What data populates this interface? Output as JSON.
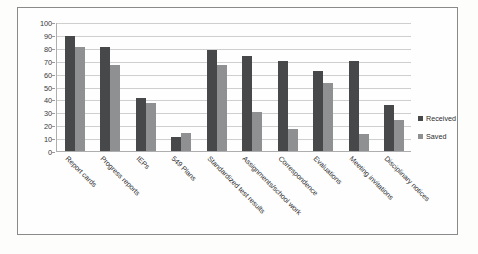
{
  "chart_data": {
    "type": "bar",
    "title": "",
    "subtitle": "",
    "xlabel": "",
    "ylabel": "",
    "ylim": [
      0,
      100
    ],
    "ytick_step": 10,
    "yticks": [
      100,
      90,
      80,
      70,
      60,
      50,
      40,
      30,
      20,
      10,
      0
    ],
    "grid": true,
    "grid_axis": "y",
    "legend_position": "right",
    "orientation": "vertical",
    "grouping": "grouped",
    "categories": [
      "Report cards",
      "Progress reports",
      "IEPs",
      "549 Plans",
      "Standardized test results",
      "Assignments/school work",
      "Correspondence",
      "Evaluations",
      "Meeting invitations",
      "Disciplinary notices"
    ],
    "series": [
      {
        "name": "Received",
        "color": "#46484a",
        "values": [
          89,
          81,
          41,
          11,
          78,
          74,
          70,
          62,
          70,
          36
        ]
      },
      {
        "name": "Saved",
        "color": "#8e9092",
        "values": [
          81,
          67,
          37,
          14,
          67,
          30,
          17,
          53,
          13,
          24
        ]
      }
    ]
  },
  "legend": {
    "items": [
      {
        "label": "Received",
        "swatch": "received"
      },
      {
        "label": "Saved",
        "swatch": "saved"
      }
    ]
  },
  "colors": {
    "received": "#46484a",
    "saved": "#8e9092",
    "gridline": "#cfcfcf",
    "axis": "#aeaeae",
    "frame": "#8a8a8a",
    "background": "#fefefe",
    "text": "#2f2f2f"
  }
}
